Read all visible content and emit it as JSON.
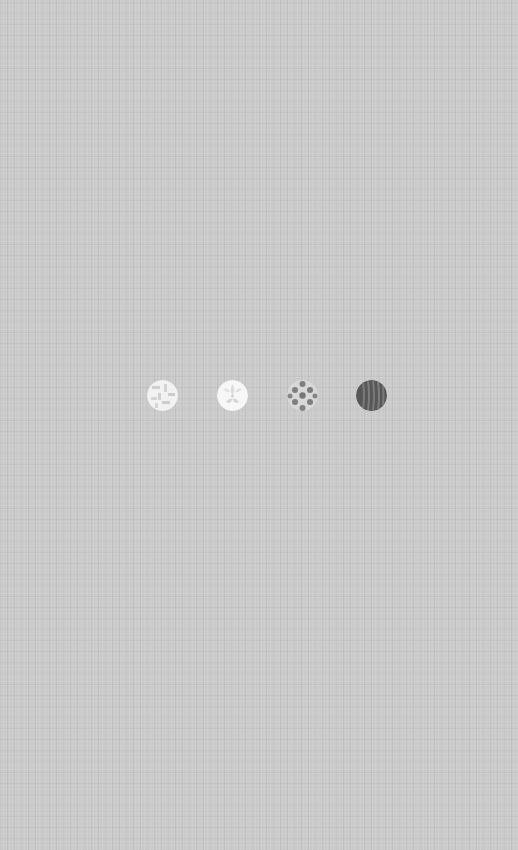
{
  "screen": {
    "background_color": "#c9c9c9",
    "description": "textured gray linen background"
  },
  "pattern_picker": {
    "swatches": [
      {
        "name": "light-geometric-pattern",
        "center_x": 162,
        "center_y": 395,
        "base_color": "#f2f2f2",
        "motif_color": "#c8c8c8"
      },
      {
        "name": "white-floral-pattern",
        "center_x": 232,
        "center_y": 395,
        "base_color": "#f7f7f7",
        "motif_color": "#d4d4d4"
      },
      {
        "name": "gray-scale-pattern",
        "center_x": 302,
        "center_y": 395,
        "base_color": "#d8d8d8",
        "motif_color": "#7d7d7d"
      },
      {
        "name": "dark-stripe-pattern",
        "center_x": 371,
        "center_y": 395,
        "base_color": "#5a5a5a",
        "motif_color": "#7a7a7a"
      }
    ]
  }
}
